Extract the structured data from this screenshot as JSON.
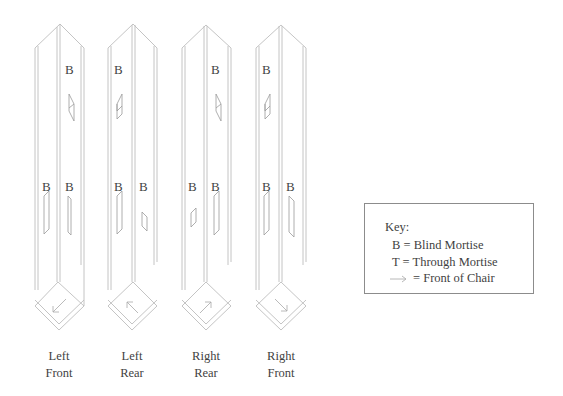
{
  "posts": [
    {
      "label_line1": "Left",
      "label_line2": "Front",
      "arrow_direction": "down-left",
      "upper_letters": [
        "B"
      ],
      "lower_letters": [
        "B",
        "B"
      ]
    },
    {
      "label_line1": "Left",
      "label_line2": "Rear",
      "arrow_direction": "up-left",
      "upper_letters": [
        "B"
      ],
      "lower_letters": [
        "B",
        "B"
      ]
    },
    {
      "label_line1": "Right",
      "label_line2": "Rear",
      "arrow_direction": "up-right",
      "upper_letters": [
        "B"
      ],
      "lower_letters": [
        "B",
        "B"
      ]
    },
    {
      "label_line1": "Right",
      "label_line2": "Front",
      "arrow_direction": "down-right",
      "upper_letters": [
        "B"
      ],
      "lower_letters": [
        "B",
        "B"
      ]
    }
  ],
  "key": {
    "title": "Key:",
    "rows": [
      {
        "symbol": "B",
        "text": "= Blind Mortise"
      },
      {
        "symbol": "T",
        "text": "= Through Mortise"
      },
      {
        "symbol": "arrow-icon",
        "text": "= Front of Chair"
      }
    ]
  },
  "colors": {
    "line": "#bdbdbd",
    "text": "#3f3f3f",
    "key_border": "#8c8c8c"
  }
}
